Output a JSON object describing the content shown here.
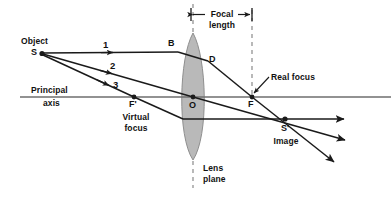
{
  "figure": {
    "type": "ray-diagram",
    "background_color": "#ffffff",
    "ink_color": "#1a1a1a",
    "axis_color": "#6e6e6e",
    "lens_fill_color": "#b9b9b9",
    "lens_stroke_color": "#8a8a8a",
    "dash_color": "#8a8a8a"
  },
  "labels": {
    "object": "Object",
    "object_point": "S",
    "principal": "Principal",
    "axis": "axis",
    "virtual_focus_point": "F'",
    "virtual_focus_line1": "Virtual",
    "virtual_focus_line2": "focus",
    "lens_center_point": "O",
    "lens_top_point": "B",
    "lens_exit_point": "D",
    "real_focus_point": "F",
    "real_focus_callout": "Real focus",
    "focal_length_line1": "Focal",
    "focal_length_line2": "length",
    "image_point": "S'",
    "image_caption": "Image",
    "lens_plane_line1": "Lens",
    "lens_plane_line2": "plane",
    "ray1": "1",
    "ray2": "2",
    "ray3": "3"
  },
  "geometry": {
    "principal_axis_y": 97,
    "axis_x_start": 20,
    "axis_x_end": 391,
    "object_s": {
      "x": 41,
      "y": 53
    },
    "lens_center": {
      "x": 193,
      "y": 97
    },
    "lens_top": {
      "x": 193,
      "y": 33
    },
    "lens_bottom": {
      "x": 193,
      "y": 160
    },
    "lens_half_width": 16,
    "point_b": {
      "x": 178,
      "y": 50
    },
    "point_d": {
      "x": 208,
      "y": 61
    },
    "virtual_focus_f_prime": {
      "x": 134,
      "y": 97
    },
    "real_focus_f": {
      "x": 252,
      "y": 97
    },
    "image_s_prime": {
      "x": 285,
      "y": 119
    },
    "focal_length_bar_y": 14,
    "focal_length_from_x": 191,
    "focal_length_to_x": 252
  },
  "rays": [
    {
      "name": "ray-1-parallel",
      "label": "1",
      "note": "parallel to axis, refracts through real focus F"
    },
    {
      "name": "ray-2-through-center",
      "label": "2",
      "note": "passes undeviated through optical center O"
    },
    {
      "name": "ray-3-through-virtual-focus",
      "label": "3",
      "note": "passes through virtual focus F', emerges parallel"
    }
  ]
}
